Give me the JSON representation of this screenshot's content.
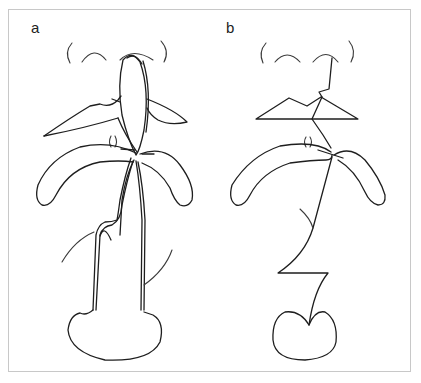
{
  "figure": {
    "panels": [
      {
        "id": "a",
        "label": "a",
        "description": "Organ outlines with double-line tract drawn along anatomical course"
      },
      {
        "id": "b",
        "label": "b",
        "description": "Organ outlines with single zig-zag line tract"
      }
    ],
    "colors": {
      "stroke": "#1e1e1e",
      "frame": "#c8c8c8",
      "background": "#ffffff"
    }
  }
}
